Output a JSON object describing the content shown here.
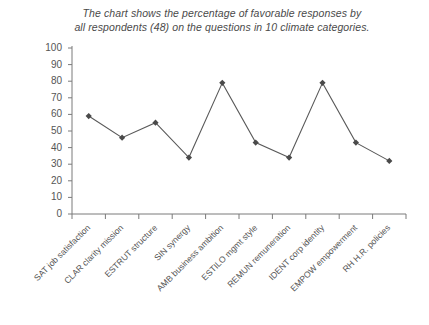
{
  "chart_data": {
    "type": "line",
    "title": "The chart shows the percentage of favorable responses by all respondents (48) on the questions in 10 climate categories.",
    "title_lines": [
      "The chart shows the percentage of favorable responses by",
      "all respondents (48) on the questions in 10 climate categories."
    ],
    "categories": [
      "SAT job satisfaction",
      "CLAR clarity mission",
      "ESTRUT structure",
      "SIN synergy",
      "AMB business ambition",
      "ESTILO mgmt style",
      "REMUN remuneration",
      "IDENT corp identity",
      "EMPOW empowerment",
      "RH H.R. policies"
    ],
    "values": [
      59,
      46,
      55,
      34,
      79,
      43,
      34,
      79,
      43,
      32
    ],
    "xlabel": "",
    "ylabel": "",
    "ylim": [
      0,
      100
    ],
    "yticks": [
      100,
      90,
      80,
      70,
      60,
      50,
      40,
      30,
      20,
      10,
      0
    ],
    "ytick_labels": [
      "100",
      "90",
      "80",
      "70",
      "60",
      "50",
      "40",
      "30",
      "20",
      "10",
      "0"
    ],
    "grid": false,
    "legend": null,
    "series_color": "#595959",
    "marker": "diamond",
    "axis_color": "#7a7a7a"
  },
  "colors": {
    "background": "#ffffff",
    "line": "#595959",
    "marker": "#4a4a4a",
    "axis": "#7a7a7a",
    "text": "#555555"
  }
}
